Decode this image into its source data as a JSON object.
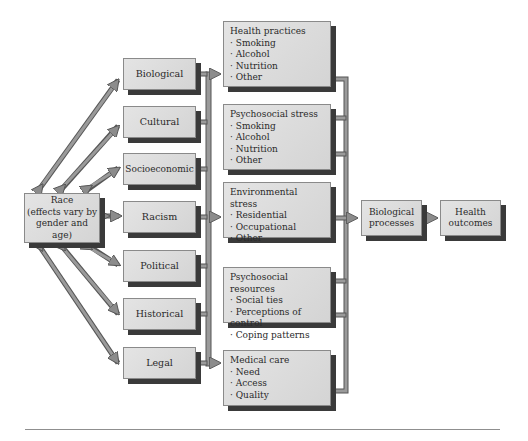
{
  "diagram": {
    "source": {
      "label": "Race\n(effects vary by gender and age)",
      "lines": [
        "Race",
        "(effects vary by",
        "gender and age)"
      ]
    },
    "factors": [
      {
        "label": "Biological"
      },
      {
        "label": "Cultural"
      },
      {
        "label": "Socioeconomic"
      },
      {
        "label": "Racism"
      },
      {
        "label": "Political"
      },
      {
        "label": "Historical"
      },
      {
        "label": "Legal"
      }
    ],
    "mediators": [
      {
        "title": "Health practices",
        "items": [
          "Smoking",
          "Alcohol",
          "Nutrition",
          "Other"
        ]
      },
      {
        "title": "Psychosocial stress",
        "items": [
          "Smoking",
          "Alcohol",
          "Nutrition",
          "Other"
        ]
      },
      {
        "title": "Environmental stress",
        "items": [
          "Residential",
          "Occupational",
          "Other"
        ]
      },
      {
        "title": "Psychosocial resources",
        "items": [
          "Social ties",
          "Perceptions of control",
          "Coping patterns"
        ]
      },
      {
        "title": "Medical care",
        "items": [
          "Need",
          "Access",
          "Quality"
        ]
      }
    ],
    "process": {
      "lines": [
        "Biological",
        "processes"
      ]
    },
    "outcome": {
      "lines": [
        "Health",
        "outcomes"
      ]
    },
    "colors": {
      "box_fill": "#dcdcdc",
      "box_shadow": "#3a3a3a",
      "arrow_fill": "#9a9a9a",
      "arrow_stroke": "#555555"
    }
  }
}
